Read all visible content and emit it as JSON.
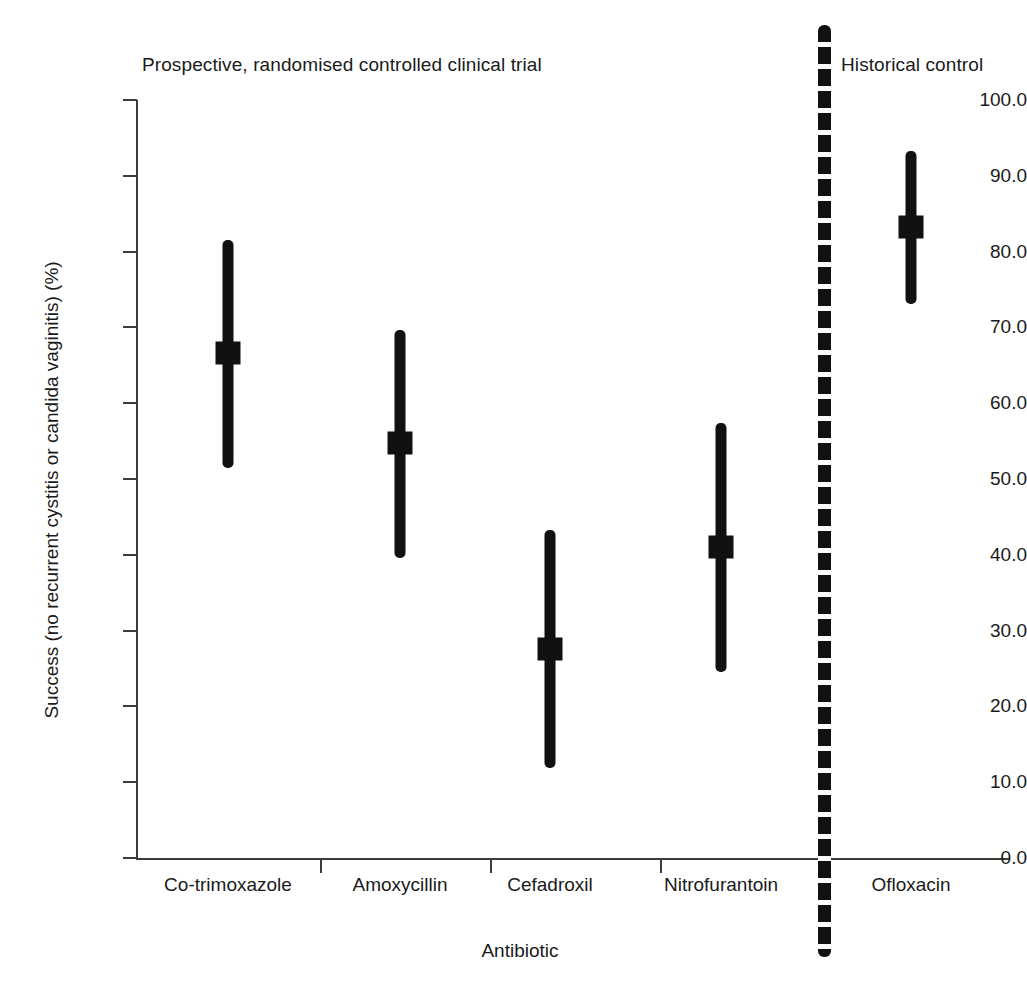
{
  "figure": {
    "width": 1027,
    "height": 998,
    "background": "#ffffff",
    "ink_color": "#111111",
    "axis_color": "#3c3c3c"
  },
  "panels": {
    "left_title": "Prospective, randomised controlled clinical trial",
    "right_title": "Historical control",
    "separator": "dotted-vertical-divider"
  },
  "chart_data": {
    "type": "scatter",
    "title": "",
    "xlabel": "Antibiotic",
    "ylabel": "Success (no recurrent cystitis or candida vaginitis) (%)",
    "ylim": [
      0.0,
      100.0
    ],
    "ytick_labels": [
      "100.0",
      "90.0",
      "80.0",
      "70.0",
      "60.0",
      "50.0",
      "40.0",
      "30.0",
      "20.0",
      "10.0",
      "0.0"
    ],
    "ytick_values": [
      100.0,
      90.0,
      80.0,
      70.0,
      60.0,
      50.0,
      40.0,
      30.0,
      20.0,
      10.0,
      0.0
    ],
    "grid": false,
    "legend": "none",
    "categories": [
      "Co-trimoxazole",
      "Amoxycillin",
      "Cefadroxil",
      "Nitrofurantoin",
      "Ofloxacin"
    ],
    "series": [
      {
        "name": "Success rate with 95% confidence interval",
        "marker": "filled-square",
        "errorbar": "vertical-capless",
        "points": [
          {
            "category": "Co-trimoxazole",
            "group": "Prospective, randomised controlled clinical trial",
            "value": 66.6,
            "ci_low": 51.5,
            "ci_high": 81.5
          },
          {
            "category": "Amoxycillin",
            "group": "Prospective, randomised controlled clinical trial",
            "value": 54.7,
            "ci_low": 39.6,
            "ci_high": 69.7
          },
          {
            "category": "Cefadroxil",
            "group": "Prospective, randomised controlled clinical trial",
            "value": 27.6,
            "ci_low": 11.9,
            "ci_high": 43.3
          },
          {
            "category": "Nitrofurantoin",
            "group": "Prospective, randomised controlled clinical trial",
            "value": 41.0,
            "ci_low": 24.6,
            "ci_high": 57.4
          },
          {
            "category": "Ofloxacin",
            "group": "Historical control",
            "value": 83.3,
            "ci_low": 73.1,
            "ci_high": 93.3
          }
        ]
      }
    ]
  }
}
